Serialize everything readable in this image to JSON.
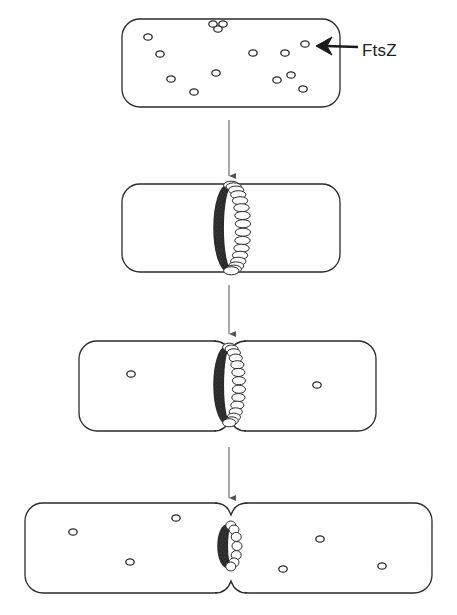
{
  "diagram": {
    "label": "FtsZ",
    "colors": {
      "outline": "#2a2a2a",
      "dark_subunit": "#2b2b2b",
      "light_subunit": "#ffffff",
      "arrow": "#555555",
      "background": "#ffffff"
    },
    "stages": [
      {
        "id": "stage-1",
        "description": "Free FtsZ monomers scattered in cytoplasm",
        "cells": [
          {
            "x": 122,
            "y": 19,
            "w": 218,
            "h": 88,
            "r": 18
          }
        ],
        "monomers": [
          [
            148,
            37
          ],
          [
            160,
            54
          ],
          [
            305,
            44
          ],
          [
            285,
            53
          ],
          [
            253,
            53
          ],
          [
            171,
            79
          ],
          [
            216,
            73
          ],
          [
            194,
            92
          ],
          [
            277,
            80
          ],
          [
            291,
            75
          ],
          [
            303,
            89
          ],
          [
            213,
            24
          ],
          [
            223,
            24
          ],
          [
            218,
            29
          ]
        ]
      },
      {
        "id": "stage-2",
        "description": "FtsZ polymerizes into a Z-ring at midcell",
        "cells": [
          {
            "x": 122,
            "y": 184,
            "w": 218,
            "h": 88,
            "r": 18
          }
        ],
        "ring": {
          "cx": 228,
          "cy": 228,
          "rx": 14,
          "ry": 43,
          "subunits": 16
        }
      },
      {
        "id": "stage-3",
        "description": "Septum invaginates as Z-ring constricts",
        "cells": [
          {
            "x": 79,
            "y": 341,
            "w": 152,
            "h": 90,
            "r": 18
          },
          {
            "x": 229,
            "y": 341,
            "w": 147,
            "h": 90,
            "r": 18
          }
        ],
        "ring": {
          "cx": 226,
          "cy": 385,
          "rx": 12,
          "ry": 38,
          "subunits": 14
        },
        "monomers": [
          [
            131,
            374
          ],
          [
            317,
            385
          ]
        ]
      },
      {
        "id": "stage-4",
        "description": "Ring depolymerizes; daughter cells separate",
        "cells": [
          {
            "x": 25,
            "y": 503,
            "w": 206,
            "h": 90,
            "r": 18
          },
          {
            "x": 231,
            "y": 503,
            "w": 201,
            "h": 90,
            "r": 18
          }
        ],
        "ring": {
          "cx": 227,
          "cy": 546,
          "rx": 9,
          "ry": 21,
          "subunits": 7
        },
        "monomers": [
          [
            73,
            532
          ],
          [
            176,
            518
          ],
          [
            130,
            562
          ],
          [
            320,
            539
          ],
          [
            283,
            569
          ],
          [
            382,
            566
          ]
        ]
      }
    ],
    "arrows": [
      {
        "x": 229,
        "y1": 120,
        "y2": 176
      },
      {
        "x": 229,
        "y1": 285,
        "y2": 334
      },
      {
        "x": 229,
        "y1": 447,
        "y2": 498
      }
    ],
    "pointer_arrow": {
      "from_x": 358,
      "from_y": 47,
      "to_x": 316,
      "to_y": 45
    }
  }
}
